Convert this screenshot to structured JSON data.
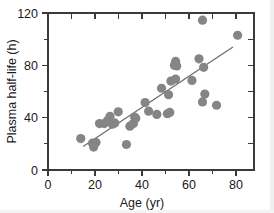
{
  "chart_data": {
    "type": "scatter",
    "title": "",
    "xlabel": "Age (yr)",
    "ylabel": "Plasma half-life (h)",
    "xlim": [
      0,
      88
    ],
    "ylim": [
      0,
      120
    ],
    "xticks": [
      0,
      20,
      40,
      60,
      80
    ],
    "xtick_labels": [
      "0",
      "20",
      "40",
      "60",
      "80"
    ],
    "x_minor_ticks": [
      10,
      30,
      50,
      70
    ],
    "yticks": [
      0,
      40,
      80,
      120
    ],
    "ytick_labels": [
      "0",
      "40",
      "80",
      "120"
    ],
    "y_minor_ticks": [
      20,
      60,
      100
    ],
    "grid": false,
    "legend": null,
    "marker": {
      "shape": "circle",
      "color": "#858585",
      "size": 4.6
    },
    "series": [
      {
        "name": "Subjects",
        "points": [
          {
            "x": 14.0,
            "y": 24.0
          },
          {
            "x": 19.0,
            "y": 20.5
          },
          {
            "x": 19.5,
            "y": 17.5
          },
          {
            "x": 20.5,
            "y": 21.0
          },
          {
            "x": 22.0,
            "y": 35.5
          },
          {
            "x": 24.0,
            "y": 35.5
          },
          {
            "x": 25.5,
            "y": 38.0
          },
          {
            "x": 26.5,
            "y": 41.0
          },
          {
            "x": 27.5,
            "y": 35.0
          },
          {
            "x": 28.5,
            "y": 36.0
          },
          {
            "x": 30.0,
            "y": 44.5
          },
          {
            "x": 33.5,
            "y": 19.5
          },
          {
            "x": 35.0,
            "y": 33.5
          },
          {
            "x": 36.5,
            "y": 35.5
          },
          {
            "x": 37.0,
            "y": 40.5
          },
          {
            "x": 37.5,
            "y": 39.5
          },
          {
            "x": 41.5,
            "y": 51.5
          },
          {
            "x": 43.0,
            "y": 45.0
          },
          {
            "x": 46.5,
            "y": 42.5
          },
          {
            "x": 48.5,
            "y": 62.5
          },
          {
            "x": 51.0,
            "y": 43.0
          },
          {
            "x": 52.0,
            "y": 44.0
          },
          {
            "x": 51.5,
            "y": 57.5
          },
          {
            "x": 52.5,
            "y": 68.0
          },
          {
            "x": 54.5,
            "y": 69.5
          },
          {
            "x": 54.0,
            "y": 80.0
          },
          {
            "x": 55.0,
            "y": 79.5
          },
          {
            "x": 54.5,
            "y": 83.0
          },
          {
            "x": 61.5,
            "y": 68.5
          },
          {
            "x": 64.5,
            "y": 85.0
          },
          {
            "x": 66.0,
            "y": 114.5
          },
          {
            "x": 66.5,
            "y": 78.5
          },
          {
            "x": 66.0,
            "y": 52.0
          },
          {
            "x": 67.0,
            "y": 58.0
          },
          {
            "x": 72.0,
            "y": 49.5
          },
          {
            "x": 81.0,
            "y": 103.0
          }
        ]
      }
    ],
    "fit_line": {
      "name": "Linear regression",
      "color": "#6e6e6e",
      "x_start": 15.0,
      "y_start": 18.0,
      "x_end": 79.0,
      "y_end": 94.0
    }
  },
  "axes": {
    "frame": "box",
    "tick_direction": "in-out"
  }
}
